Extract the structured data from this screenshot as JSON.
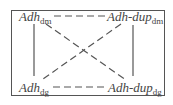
{
  "diagram": {
    "nodes": {
      "top_left": {
        "name": "Adh",
        "sub": "dm"
      },
      "top_right": {
        "name": "Adh-dup",
        "sub": "dm"
      },
      "bottom_left": {
        "name": "Adh",
        "sub": "dg"
      },
      "bottom_right": {
        "name": "Adh-dup",
        "sub": "dg"
      }
    },
    "edges": [
      {
        "from": "top_left",
        "to": "top_right",
        "style": "dashed"
      },
      {
        "from": "bottom_left",
        "to": "bottom_right",
        "style": "dashed"
      },
      {
        "from": "top_left",
        "to": "bottom_left",
        "style": "solid"
      },
      {
        "from": "top_right",
        "to": "bottom_right",
        "style": "solid"
      },
      {
        "from": "top_left",
        "to": "bottom_right",
        "style": "dashed"
      },
      {
        "from": "top_right",
        "to": "bottom_left",
        "style": "dashed"
      }
    ],
    "colors": {
      "line": "#555555",
      "text": "#444444"
    }
  }
}
